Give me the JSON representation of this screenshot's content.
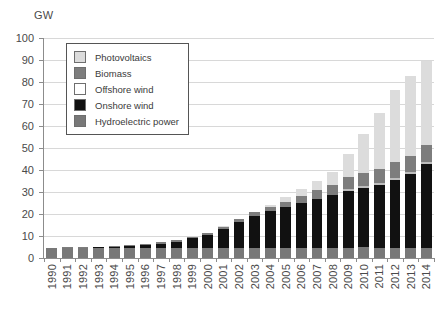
{
  "chart_data": {
    "type": "bar",
    "stacked": true,
    "title": "",
    "xlabel": "",
    "ylabel": "GW",
    "ylim": [
      0,
      100
    ],
    "yticks": [
      0,
      10,
      20,
      30,
      40,
      50,
      60,
      70,
      80,
      90,
      100
    ],
    "grid": true,
    "legend_position": "upper-left-inside",
    "categories": [
      "1990",
      "1991",
      "1992",
      "1993",
      "1994",
      "1995",
      "1996",
      "1997",
      "1998",
      "1999",
      "2000",
      "2001",
      "2002",
      "2003",
      "2004",
      "2005",
      "2006",
      "2007",
      "2008",
      "2009",
      "2010",
      "2011",
      "2012",
      "2013",
      "2014"
    ],
    "series": [
      {
        "name": "Hydroelectric power",
        "color": "#787878",
        "values": [
          4.4,
          4.4,
          4.4,
          4.4,
          4.4,
          4.5,
          4.5,
          4.5,
          4.5,
          4.5,
          4.5,
          4.5,
          4.5,
          4.6,
          4.6,
          4.6,
          4.6,
          4.7,
          4.7,
          4.7,
          4.8,
          4.4,
          4.4,
          4.6,
          4.6
        ]
      },
      {
        "name": "Onshore wind",
        "color": "#111111",
        "values": [
          0.1,
          0.2,
          0.3,
          0.4,
          0.6,
          1.1,
          1.5,
          2.1,
          2.9,
          4.4,
          6.1,
          8.8,
          11.9,
          14.6,
          16.6,
          18.4,
          20.6,
          22.2,
          23.8,
          25.7,
          27.0,
          28.7,
          31.2,
          33.6,
          38.1
        ]
      },
      {
        "name": "Offshore wind",
        "color": "#ffffff",
        "values": [
          0,
          0,
          0,
          0,
          0,
          0,
          0,
          0,
          0,
          0,
          0,
          0,
          0,
          0,
          0,
          0,
          0,
          0,
          0,
          0.04,
          0.1,
          0.2,
          0.3,
          0.9,
          1.0
        ]
      },
      {
        "name": "Biomass",
        "color": "#7d7d7d",
        "values": [
          0.2,
          0.2,
          0.2,
          0.3,
          0.3,
          0.4,
          0.4,
          0.5,
          0.6,
          0.7,
          0.8,
          1.0,
          1.2,
          1.5,
          1.9,
          2.5,
          3.2,
          3.9,
          4.6,
          5.3,
          6.0,
          6.5,
          7.0,
          7.3,
          7.6
        ]
      },
      {
        "name": "Photovoltaics",
        "color": "#dcdcdc",
        "values": [
          0,
          0,
          0,
          0,
          0,
          0,
          0,
          0,
          0.1,
          0.1,
          0.1,
          0.2,
          0.3,
          0.4,
          1.1,
          2.1,
          2.9,
          4.2,
          6.1,
          10.6,
          17.9,
          25.4,
          33.0,
          36.3,
          38.2
        ]
      }
    ]
  },
  "legend": {
    "items": [
      {
        "label": "Photovoltaics",
        "color": "#dcdcdc"
      },
      {
        "label": "Biomass",
        "color": "#7d7d7d"
      },
      {
        "label": "Offshore wind",
        "color": "#ffffff"
      },
      {
        "label": "Onshore wind",
        "color": "#111111"
      },
      {
        "label": "Hydroelectric power",
        "color": "#787878"
      }
    ]
  },
  "axis": {
    "unit_label": "GW"
  }
}
